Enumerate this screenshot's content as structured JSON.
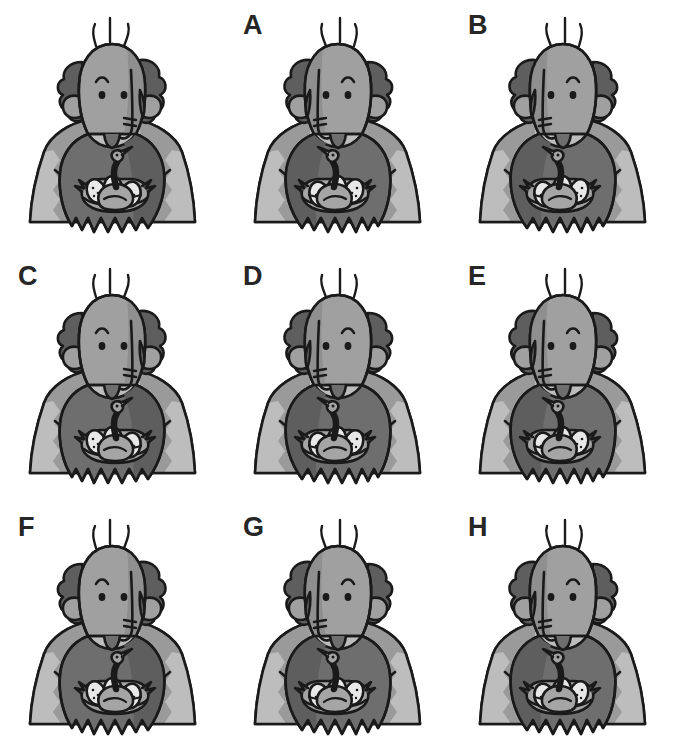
{
  "page": {
    "background_color": "#ffffff",
    "width": 675,
    "height": 753,
    "grid": {
      "rows": 3,
      "columns": 3
    }
  },
  "palette": {
    "outline": "#1a1a1a",
    "skin": "#a0a0a0",
    "skin_shadow": "#8f8f8f",
    "hair": "#5e5e5e",
    "beard": "#6e6e6e",
    "shirt_light": "#bdbdbd",
    "shirt_mid": "#9a9a9a",
    "duck": "#a5a5a5",
    "egg": "#e8e8e8",
    "nest": "#4a4a4a",
    "label_color": "#262626",
    "background": "#ffffff"
  },
  "figure": {
    "parts": [
      "antennae-hairs",
      "bald-head",
      "curly-side-hair",
      "ears",
      "eyebrow",
      "eyes",
      "long-nose",
      "mouth-lines",
      "beard",
      "shirt",
      "collar",
      "nest",
      "duck",
      "eggs"
    ],
    "egg_count": 3,
    "duck_count": 1,
    "antenna_count": 3
  },
  "cells": [
    {
      "id": "cell-0",
      "label": "",
      "has_label": false,
      "mirrored": false,
      "row": 1,
      "column": 1
    },
    {
      "id": "cell-1",
      "label": "A",
      "has_label": true,
      "mirrored": true,
      "row": 1,
      "column": 2
    },
    {
      "id": "cell-2",
      "label": "B",
      "has_label": true,
      "mirrored": true,
      "row": 1,
      "column": 3
    },
    {
      "id": "cell-3",
      "label": "C",
      "has_label": true,
      "mirrored": false,
      "row": 2,
      "column": 1
    },
    {
      "id": "cell-4",
      "label": "D",
      "has_label": true,
      "mirrored": true,
      "row": 2,
      "column": 2
    },
    {
      "id": "cell-5",
      "label": "E",
      "has_label": true,
      "mirrored": true,
      "row": 2,
      "column": 3
    },
    {
      "id": "cell-6",
      "label": "F",
      "has_label": true,
      "mirrored": false,
      "row": 3,
      "column": 1
    },
    {
      "id": "cell-7",
      "label": "G",
      "has_label": true,
      "mirrored": true,
      "row": 3,
      "column": 2
    },
    {
      "id": "cell-8",
      "label": "H",
      "has_label": true,
      "mirrored": true,
      "row": 3,
      "column": 3
    }
  ]
}
